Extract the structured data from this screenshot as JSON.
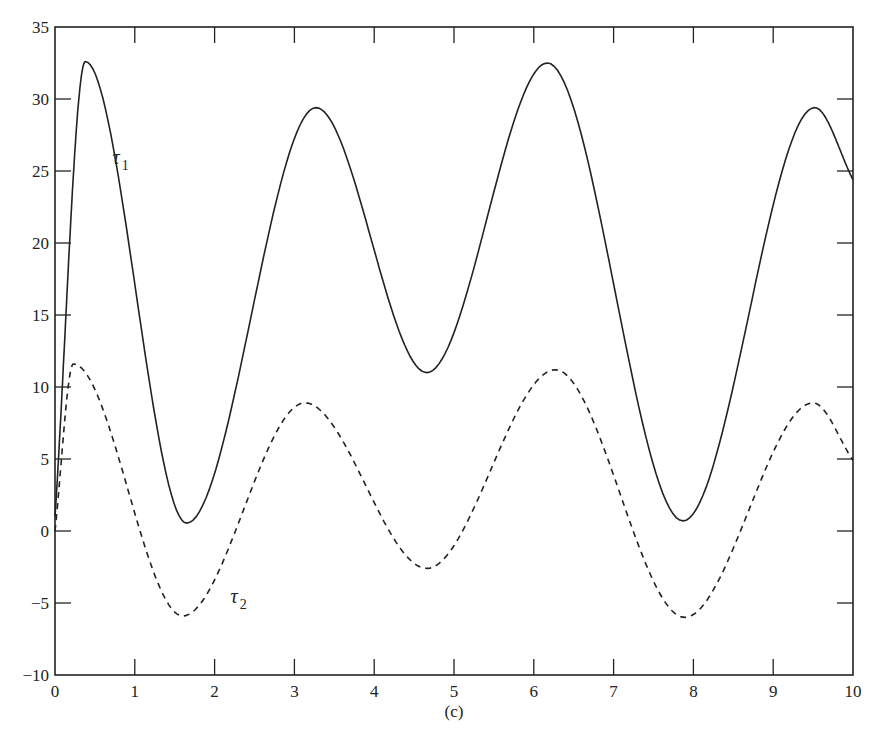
{
  "chart_data": {
    "type": "line",
    "title": "",
    "caption": "(c)",
    "xlabel": "",
    "ylabel": "",
    "xlim": [
      0,
      10
    ],
    "ylim": [
      -10,
      35
    ],
    "x_ticks": [
      0,
      1,
      2,
      3,
      4,
      5,
      6,
      7,
      8,
      9,
      10
    ],
    "x_tick_labels": [
      "0",
      "1",
      "2",
      "3",
      "4",
      "5",
      "6",
      "7",
      "8",
      "9",
      "10"
    ],
    "y_ticks": [
      -10,
      -5,
      0,
      5,
      10,
      15,
      20,
      25,
      30,
      35
    ],
    "y_tick_labels": [
      "−10",
      "−5",
      "0",
      "5",
      "10",
      "15",
      "20",
      "25",
      "30",
      "35"
    ],
    "grid": false,
    "legend": "inline labels",
    "series": [
      {
        "name": "τ1",
        "label_base": "τ",
        "label_sub": "1",
        "style": "solid",
        "label_pos": [
          0.72,
          25.5
        ],
        "keypoints": {
          "x": [
            0,
            0.38,
            1.65,
            3.27,
            4.66,
            6.17,
            7.87,
            9.52,
            10
          ],
          "y": [
            1,
            32.6,
            0.55,
            29.4,
            11.0,
            32.5,
            0.7,
            29.4,
            24.4
          ]
        }
      },
      {
        "name": "τ2",
        "label_base": "τ",
        "label_sub": "2",
        "style": "dashed",
        "label_pos": [
          2.2,
          -5.0
        ],
        "keypoints": {
          "x": [
            0,
            0.23,
            1.6,
            3.13,
            4.66,
            6.27,
            7.89,
            9.5,
            10
          ],
          "y": [
            0,
            11.6,
            -5.9,
            8.9,
            -2.6,
            11.2,
            -6.0,
            8.9,
            4.9
          ]
        }
      }
    ]
  },
  "colors": {
    "axis": "#222222",
    "line": "#222222",
    "background": "#ffffff"
  }
}
